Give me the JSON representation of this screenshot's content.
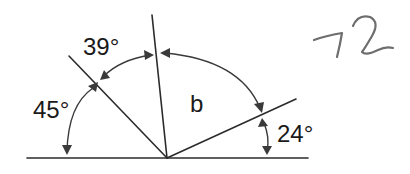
{
  "diagram": {
    "title": "",
    "labels": {
      "angle_left": "45°",
      "angle_upper_left": "39°",
      "angle_unknown": "b",
      "angle_right": "24°"
    },
    "handwritten_answer": "72",
    "angles": [
      {
        "name": "left",
        "value_deg": 45,
        "between": [
          "baseline-left",
          "ray-45"
        ]
      },
      {
        "name": "upper-left",
        "value_deg": 39,
        "between": [
          "ray-45",
          "ray-vertical"
        ]
      },
      {
        "name": "unknown",
        "symbol": "b",
        "between": [
          "ray-vertical",
          "ray-24"
        ]
      },
      {
        "name": "right",
        "value_deg": 24,
        "between": [
          "ray-24",
          "baseline-right"
        ]
      }
    ],
    "colors": {
      "lines": "#2b2b2b",
      "arcs": "#3a3a3a",
      "text": "#1a1a1a",
      "handwriting": "#6e6e6e",
      "background": "#ffffff"
    }
  }
}
